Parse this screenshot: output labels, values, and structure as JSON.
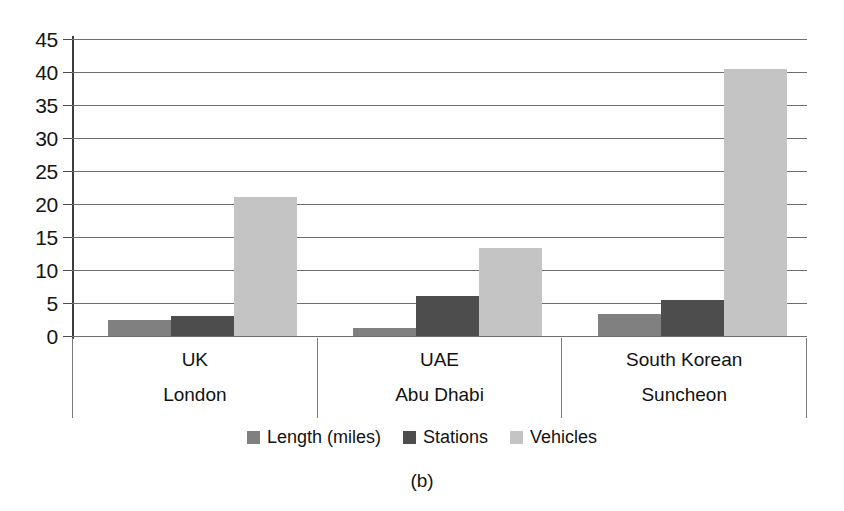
{
  "chart_data": {
    "type": "bar",
    "title": "",
    "subtitle": "",
    "caption": "(b)",
    "xlabel": "",
    "ylabel": "",
    "grid": true,
    "legend_position": "bottom",
    "ylim": [
      0,
      45
    ],
    "ytick_step": 5,
    "ytick_labels": [
      "45",
      "40",
      "35",
      "30",
      "25",
      "20",
      "15",
      "10",
      "5",
      "0"
    ],
    "ytick_values": [
      45,
      40,
      35,
      30,
      25,
      20,
      15,
      10,
      5,
      0
    ],
    "categories": [
      "UK",
      "UAE",
      "South Korean"
    ],
    "category_sublabels": [
      "London",
      "Abu Dhabi",
      "Suncheon"
    ],
    "series": [
      {
        "name": "Length (miles)",
        "color": "#808080",
        "values": [
          2.5,
          1.2,
          3.3
        ]
      },
      {
        "name": "Stations",
        "color": "#4d4d4d",
        "values": [
          3.1,
          6.1,
          5.5
        ]
      },
      {
        "name": "Vehicles",
        "color": "#c4c4c4",
        "values": [
          21.0,
          13.3,
          40.5
        ]
      }
    ]
  }
}
